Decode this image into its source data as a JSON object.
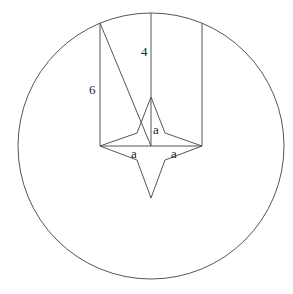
{
  "diagram": {
    "type": "geometry",
    "circle": {
      "cx": 151,
      "cy": 146,
      "r": 133
    },
    "labels": {
      "center_vertical": "4",
      "left_vertical": "6",
      "star_half_height": "a",
      "star_left_half": "a",
      "star_right_half": "a"
    },
    "colors": {
      "stroke": "#555555",
      "text": "#222222",
      "background": "#ffffff"
    }
  }
}
